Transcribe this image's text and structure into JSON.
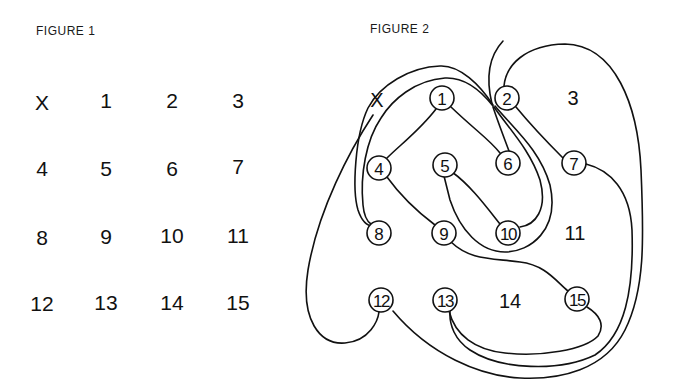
{
  "figure1": {
    "title": "FIGURE 1",
    "labels": [
      {
        "text": "X",
        "x": 42,
        "y": 102
      },
      {
        "text": "1",
        "x": 106,
        "y": 100
      },
      {
        "text": "2",
        "x": 172,
        "y": 100
      },
      {
        "text": "3",
        "x": 238,
        "y": 100
      },
      {
        "text": "4",
        "x": 42,
        "y": 168
      },
      {
        "text": "5",
        "x": 106,
        "y": 168
      },
      {
        "text": "6",
        "x": 172,
        "y": 168
      },
      {
        "text": "7",
        "x": 238,
        "y": 166
      },
      {
        "text": "8",
        "x": 42,
        "y": 237
      },
      {
        "text": "9",
        "x": 106,
        "y": 236
      },
      {
        "text": "10",
        "x": 172,
        "y": 235
      },
      {
        "text": "11",
        "x": 238,
        "y": 235
      },
      {
        "text": "12",
        "x": 42,
        "y": 303
      },
      {
        "text": "13",
        "x": 106,
        "y": 302
      },
      {
        "text": "14",
        "x": 172,
        "y": 302
      },
      {
        "text": "15",
        "x": 238,
        "y": 302
      }
    ]
  },
  "figure2": {
    "title": "FIGURE 2",
    "start_label": {
      "text": "X",
      "x": 377,
      "y": 100
    },
    "circled_nodes": [
      {
        "text": "1",
        "x": 442,
        "y": 98
      },
      {
        "text": "2",
        "x": 507,
        "y": 98
      },
      {
        "text": "4",
        "x": 379,
        "y": 168
      },
      {
        "text": "5",
        "x": 445,
        "y": 165
      },
      {
        "text": "6",
        "x": 508,
        "y": 163
      },
      {
        "text": "7",
        "x": 574,
        "y": 163
      },
      {
        "text": "8",
        "x": 379,
        "y": 233
      },
      {
        "text": "9",
        "x": 444,
        "y": 233
      },
      {
        "text": "10",
        "x": 508,
        "y": 233
      },
      {
        "text": "12",
        "x": 381,
        "y": 300
      },
      {
        "text": "13",
        "x": 445,
        "y": 300
      },
      {
        "text": "15",
        "x": 577,
        "y": 299
      }
    ],
    "plain_nodes": [
      {
        "text": "3",
        "x": 573,
        "y": 98
      },
      {
        "text": "11",
        "x": 575,
        "y": 233
      },
      {
        "text": "14",
        "x": 510,
        "y": 301
      }
    ]
  }
}
